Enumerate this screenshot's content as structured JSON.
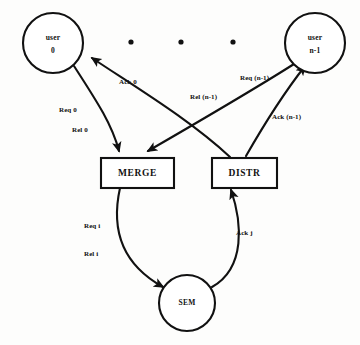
{
  "diagram": {
    "background_color": "#fdfdfc",
    "ink_color": "#111111",
    "nodes": {
      "user_left": {
        "label_line1": "user",
        "label_line2": "0",
        "shape": "circle"
      },
      "user_right": {
        "label_line1": "user",
        "label_line2": "n-1",
        "shape": "circle"
      },
      "merge": {
        "label": "MERGE",
        "shape": "rectangle"
      },
      "distr": {
        "label": "DISTR",
        "shape": "rectangle"
      },
      "sem": {
        "label": "SEM",
        "shape": "circle"
      }
    },
    "ellipsis": {
      "dot_count": 3
    },
    "edge_labels": {
      "ack_0": "Ack 0",
      "req_0": "Req 0",
      "rel_0": "Rel 0",
      "req_n1": "Req (n-1)",
      "rel_n1": "Rel (n-1)",
      "ack_n1": "Ack (n-1)",
      "req_i": "Req i",
      "rel_i": "Rel i",
      "ack_j": "Ack j"
    }
  }
}
